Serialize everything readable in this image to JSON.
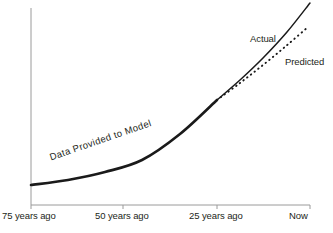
{
  "chart_data": {
    "type": "line",
    "title": "",
    "subtitle": "",
    "xlabel": "",
    "ylabel": "",
    "grid": false,
    "legend_position": "inline-annotation",
    "xlim": [
      -75,
      0
    ],
    "ylim": [
      0,
      100
    ],
    "x_tick_labels": [
      "75 years ago",
      "50 years ago",
      "25 years ago",
      "Now"
    ],
    "x_tick_values": [
      -75,
      -50,
      -25,
      0
    ],
    "x_tick_pixels": [
      31,
      123,
      217,
      310
    ],
    "annotations": [
      {
        "name": "data-provided-to-model",
        "text": "Data Provided to Model",
        "x_px": 48,
        "y_px": 152,
        "rotation_deg": -19
      }
    ],
    "series": [
      {
        "name": "Data Provided to Model",
        "style": "solid-thick",
        "color": "#1a1a1a",
        "width_px": 2.6,
        "x": [
          -75,
          -65,
          -55,
          -45,
          -35,
          -25
        ],
        "y": [
          7,
          9.5,
          13,
          18,
          25.5,
          36
        ],
        "points_px": [
          [
            31,
            185
          ],
          [
            68,
            180
          ],
          [
            105,
            172
          ],
          [
            142,
            160
          ],
          [
            180,
            134
          ],
          [
            217,
            100
          ]
        ]
      },
      {
        "name": "Actual",
        "style": "solid",
        "color": "#1a1a1a",
        "width_px": 1.5,
        "x": [
          -25,
          -19,
          -13,
          -7,
          0
        ],
        "y": [
          36,
          48,
          62,
          79,
          100
        ],
        "points_px": [
          [
            217,
            100
          ],
          [
            240,
            80
          ],
          [
            263,
            58
          ],
          [
            287,
            32
          ],
          [
            310,
            3
          ]
        ]
      },
      {
        "name": "Predicted",
        "style": "dotted",
        "color": "#1a1a1a",
        "width_px": 1.9,
        "dash_px": [
          0.5,
          4.2
        ],
        "x": [
          -25,
          -19,
          -13,
          -7,
          0
        ],
        "y": [
          36,
          46,
          57,
          69,
          83
        ],
        "points_px": [
          [
            217,
            100
          ],
          [
            240,
            83
          ],
          [
            263,
            65
          ],
          [
            286,
            46
          ],
          [
            308,
            27
          ]
        ]
      }
    ],
    "axes": {
      "color": "#9a9a9a",
      "width_px": 1,
      "y_axis_px": {
        "x": 31,
        "y_top": 8,
        "y_bottom": 205
      },
      "x_axis_px": {
        "y": 205,
        "x_left": 31,
        "x_right": 310
      },
      "tick_length_px": 4
    },
    "background": "#ffffff"
  },
  "labels": {
    "actual": "Actual",
    "predicted": "Predicted",
    "data_provided": "Data Provided to Model",
    "ticks": {
      "t0": "75 years ago",
      "t1": "50 years ago",
      "t2": "25 years ago",
      "t3": "Now"
    }
  }
}
